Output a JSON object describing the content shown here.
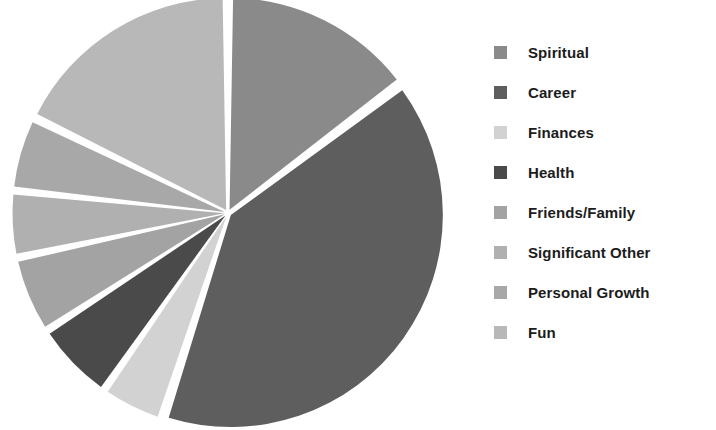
{
  "chart_data": {
    "type": "pie",
    "title": "",
    "subtitle": "",
    "xlabel": "",
    "ylabel": "",
    "legend_position": "right",
    "grid": false,
    "start_angle_deg": 0,
    "direction": "clockwise",
    "exploded": true,
    "categories": [
      "Spiritual",
      "Career",
      "Finances",
      "Health",
      "Friends/Family",
      "Significant Other",
      "Personal Growth",
      "Fun"
    ],
    "values": [
      14.7,
      40.3,
      4.7,
      6.1,
      5.8,
      5.0,
      5.6,
      17.8
    ],
    "colors": [
      "#8a8a8a",
      "#5e5e5e",
      "#d2d2d2",
      "#4a4a4a",
      "#a3a3a3",
      "#b0b0b0",
      "#a8a8a8",
      "#b8b8b8"
    ],
    "slices": [
      {
        "label": "Spiritual",
        "value": 14.7,
        "color": "#8a8a8a",
        "start_deg": 0,
        "end_deg": 53
      },
      {
        "label": "Career",
        "value": 40.3,
        "color": "#5e5e5e",
        "start_deg": 53,
        "end_deg": 198
      },
      {
        "label": "Finances",
        "value": 4.7,
        "color": "#d2d2d2",
        "start_deg": 198,
        "end_deg": 215
      },
      {
        "label": "Health",
        "value": 6.1,
        "color": "#4a4a4a",
        "start_deg": 215,
        "end_deg": 237
      },
      {
        "label": "Friends/Family",
        "value": 5.8,
        "color": "#a3a3a3",
        "start_deg": 237,
        "end_deg": 258
      },
      {
        "label": "Significant Other",
        "value": 5.0,
        "color": "#b0b0b0",
        "start_deg": 258,
        "end_deg": 276
      },
      {
        "label": "Personal Growth",
        "value": 5.6,
        "color": "#a8a8a8",
        "start_deg": 276,
        "end_deg": 296
      },
      {
        "label": "Fun",
        "value": 17.8,
        "color": "#b8b8b8",
        "start_deg": 296,
        "end_deg": 360
      }
    ]
  },
  "legend": {
    "items": [
      {
        "label": "Spiritual",
        "color": "#8a8a8a",
        "swatch_name": "legend-swatch-spiritual"
      },
      {
        "label": "Career",
        "color": "#5e5e5e",
        "swatch_name": "legend-swatch-career"
      },
      {
        "label": "Finances",
        "color": "#d2d2d2",
        "swatch_name": "legend-swatch-finances"
      },
      {
        "label": "Health",
        "color": "#4a4a4a",
        "swatch_name": "legend-swatch-health"
      },
      {
        "label": "Friends/Family",
        "color": "#a3a3a3",
        "swatch_name": "legend-swatch-friends-family"
      },
      {
        "label": "Significant Other",
        "color": "#b0b0b0",
        "swatch_name": "legend-swatch-significant-other"
      },
      {
        "label": "Personal Growth",
        "color": "#a8a8a8",
        "swatch_name": "legend-swatch-personal-growth"
      },
      {
        "label": "Fun",
        "color": "#b8b8b8",
        "swatch_name": "legend-swatch-fun"
      }
    ]
  },
  "geometry": {
    "center_x": 228,
    "center_y": 213,
    "radius": 212,
    "gap_deg": 1.9
  },
  "background_color": "#ffffff"
}
